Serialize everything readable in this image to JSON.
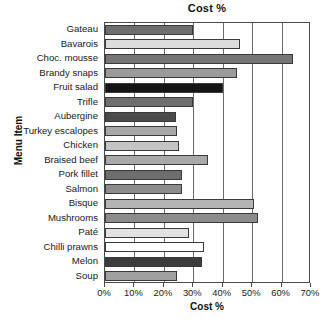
{
  "chart_data": {
    "type": "bar",
    "orientation": "horizontal",
    "title": "Cost %",
    "xlabel": "Cost %",
    "ylabel": "Menu Item",
    "xlim": [
      0,
      70
    ],
    "xticks": [
      "0%",
      "10%",
      "20%",
      "30%",
      "40%",
      "50%",
      "60%",
      "70%"
    ],
    "xtick_values": [
      0,
      10,
      20,
      30,
      40,
      50,
      60,
      70
    ],
    "grid": "vertical",
    "legend": "none",
    "categories": [
      "Gateau",
      "Bavarois",
      "Choc. mousse",
      "Brandy snaps",
      "Fruit salad",
      "Trifle",
      "Aubergine",
      "Turkey escalopes",
      "Chicken",
      "Braised beef",
      "Pork fillet",
      "Salmon",
      "Bisque",
      "Mushrooms",
      "Paté",
      "Chilli prawns",
      "Melon",
      "Soup"
    ],
    "values": [
      30,
      46,
      64,
      45,
      40,
      30,
      24,
      24.5,
      25,
      35,
      26,
      26,
      50.5,
      52,
      28.5,
      33.5,
      33,
      24.5
    ],
    "bar_colors": [
      "#6e6e6e",
      "#dcdcdc",
      "#767676",
      "#9a9a9a",
      "#141414",
      "#6e6e6e",
      "#4b4b4b",
      "#a8a8a8",
      "#c4c4c4",
      "#a8a8a8",
      "#6e6e6e",
      "#8c8c8c",
      "#b4b4b4",
      "#8c8c8c",
      "#e2e2e2",
      "#ffffff",
      "#3c3c3c",
      "#a0a0a0"
    ]
  }
}
